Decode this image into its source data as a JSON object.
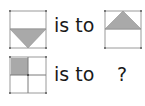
{
  "puzzle": {
    "row1": {
      "relation": "is to",
      "source_figure": "square-with-inverted-triangle-bottom-half",
      "target_figure": "square-with-upright-triangle-top-half"
    },
    "row2": {
      "relation": "is to",
      "source_figure": "2x2-grid-top-left-shaded",
      "answer": "?"
    }
  },
  "colors": {
    "shape_fill": "#a9a9a9",
    "line": "#9a9a9a",
    "text": "#1a1a1a"
  }
}
